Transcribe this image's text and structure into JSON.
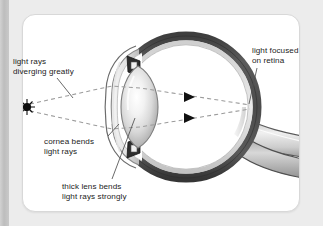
{
  "labels": {
    "diverging": {
      "line1": "light rays",
      "line2": "diverging greatly"
    },
    "focused": {
      "line1": "light focused",
      "line2": "on retina"
    },
    "cornea": {
      "line1": "cornea bends",
      "line2": "light rays"
    },
    "lens": {
      "line1": "thick lens bends",
      "line2": "light rays strongly"
    }
  },
  "parts": [
    {
      "name": "light-source",
      "label": "point light source"
    },
    {
      "name": "cornea",
      "label": "cornea"
    },
    {
      "name": "lens",
      "label": "thick lens"
    },
    {
      "name": "iris",
      "label": "iris"
    },
    {
      "name": "sclera",
      "label": "sclera"
    },
    {
      "name": "retina",
      "label": "retina"
    },
    {
      "name": "optic-nerve",
      "label": "optic nerve"
    }
  ],
  "rays": {
    "count": 2,
    "style": "dashed",
    "arrow_count": 2,
    "source_x": 27,
    "source_y": 107,
    "focus_x": 250,
    "focus_y": 107
  },
  "colors": {
    "page_background": "#ececec",
    "card_background": "#ffffff",
    "sclera_dark": "#4a4a4a",
    "sclera_mid": "#8f8f8f",
    "sclera_light": "#d6d6d6",
    "lens_highlight": "#fbfbfb",
    "lens_edge": "#9a9a9a",
    "ray_line": "#9b9b9b",
    "text": "#1b1b1b",
    "leader_line": "#4f4f4f",
    "light_source": "#0d0d0d"
  }
}
